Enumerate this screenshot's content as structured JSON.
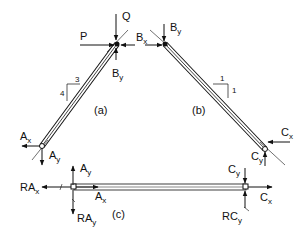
{
  "diagram": {
    "type": "free-body diagram",
    "colors": {
      "ink": "#111111",
      "background": "#ffffff",
      "member_fill": "#ffffff"
    },
    "members": {
      "a": {
        "label": "(a)",
        "slope": {
          "run": "3",
          "rise": "4"
        }
      },
      "b": {
        "label": "(b)",
        "slope": {
          "run": "1",
          "rise": "1"
        }
      },
      "c": {
        "label": "(c)"
      }
    },
    "forces": {
      "P": {
        "main": "P",
        "sub": ""
      },
      "Q": {
        "main": "Q",
        "sub": ""
      },
      "By_a": {
        "main": "B",
        "sub": "y"
      },
      "Bx_b": {
        "main": "B",
        "sub": "x"
      },
      "By_b": {
        "main": "B",
        "sub": "y"
      },
      "Ax_a": {
        "main": "A",
        "sub": "x"
      },
      "Ay_a": {
        "main": "A",
        "sub": "y"
      },
      "Cx_b": {
        "main": "C",
        "sub": "x"
      },
      "Cy_b": {
        "main": "C",
        "sub": "y"
      },
      "Ay_c": {
        "main": "A",
        "sub": "y"
      },
      "Ax_c": {
        "main": "A",
        "sub": "x"
      },
      "RAx": {
        "main": "RA",
        "sub": "x"
      },
      "RAy": {
        "main": "RA",
        "sub": "y"
      },
      "Cy_c": {
        "main": "C",
        "sub": "y"
      },
      "Cx_c": {
        "main": "C",
        "sub": "x"
      },
      "RCy": {
        "main": "RC",
        "sub": "y"
      }
    }
  }
}
